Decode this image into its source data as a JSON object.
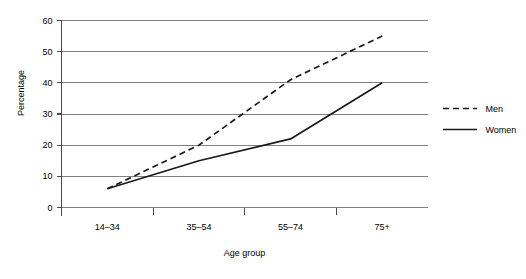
{
  "chart_data": {
    "type": "line",
    "title": "",
    "xlabel": "Age group",
    "ylabel": "Percentage",
    "categories": [
      "14–34",
      "35–54",
      "55–74",
      "75+"
    ],
    "yticks": [
      "0",
      "10",
      "20",
      "30",
      "40",
      "50",
      "60"
    ],
    "ylim": [
      0,
      60
    ],
    "grid": true,
    "legend_position": "right",
    "series": [
      {
        "name": "Men",
        "style": "dashed",
        "color": "#1a1a1a",
        "values": [
          6,
          20,
          41,
          55
        ]
      },
      {
        "name": "Women",
        "style": "solid",
        "color": "#1a1a1a",
        "values": [
          6,
          15,
          22,
          40
        ]
      }
    ]
  },
  "axes": {
    "y_label": "Percentage",
    "x_label": "Age group"
  },
  "legend": {
    "items": [
      {
        "label": "Men",
        "key": "dashed-line-key"
      },
      {
        "label": "Women",
        "key": "solid-line-key"
      }
    ]
  },
  "colors": {
    "grid": "#808080",
    "axis": "#4d4d4d",
    "series": "#1a1a1a",
    "background": "#ffffff"
  }
}
